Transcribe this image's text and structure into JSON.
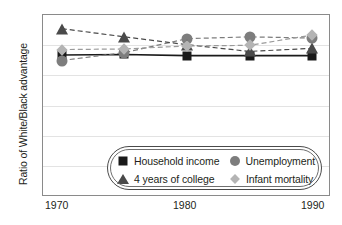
{
  "chart_data": {
    "type": "line",
    "title": "",
    "xlabel": "",
    "ylabel": "Ratio of White/Black advantage",
    "x": [
      1970,
      1975,
      1980,
      1985,
      1990
    ],
    "xlim": [
      1968.5,
      1991.5
    ],
    "xticks": [
      1970,
      1980,
      1990
    ],
    "xticklabels": [
      "1970",
      "1980",
      "1990"
    ],
    "ylim": [
      -3,
      3
    ],
    "yticks": [
      3,
      2,
      1,
      0,
      -1,
      -2,
      -3
    ],
    "yticklabels": [
      "3",
      "2",
      "1",
      "0",
      "1",
      "2",
      "3"
    ],
    "grid": true,
    "legend_position": "lower center",
    "series": [
      {
        "name": "Household income",
        "marker": "square",
        "color": "#1a1a1a",
        "linestyle": "solid",
        "values": [
          1.68,
          1.7,
          1.66,
          1.66,
          1.66
        ]
      },
      {
        "name": "Unemployment",
        "marker": "circle",
        "color": "#7d7d7d",
        "linestyle": "dashed",
        "values": [
          1.5,
          1.76,
          2.22,
          2.28,
          2.24
        ]
      },
      {
        "name": "4 years of college",
        "marker": "triangle",
        "color": "#4a4a4a",
        "linestyle": "dashed",
        "values": [
          2.55,
          2.28,
          2.02,
          1.8,
          1.9
        ]
      },
      {
        "name": "Infant mortality",
        "marker": "diamond",
        "color": "#b4b4b4",
        "linestyle": "dashed",
        "values": [
          1.86,
          1.88,
          1.98,
          2.0,
          2.34
        ]
      }
    ]
  },
  "axis": {
    "ylabel": "Ratio of White/Black advantage",
    "yticklabels": [
      "3",
      "2",
      "1",
      "0",
      "1",
      "2",
      "3"
    ],
    "xticklabels": [
      "1970",
      "1980",
      "1990"
    ]
  },
  "legend": {
    "entries": [
      {
        "label": "Household income",
        "marker": "square"
      },
      {
        "label": "Unemployment",
        "marker": "circle"
      },
      {
        "label": "4 years of college",
        "marker": "triangle"
      },
      {
        "label": "Infant mortality",
        "marker": "diamond"
      }
    ]
  }
}
